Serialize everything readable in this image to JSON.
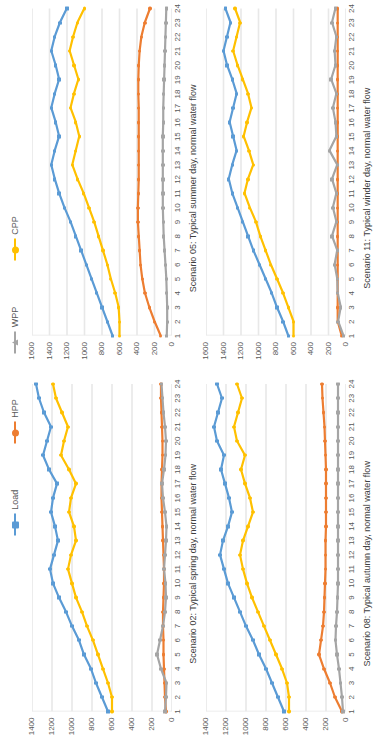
{
  "legend": {
    "items": [
      {
        "label": "Load",
        "color": "#5B9BD5",
        "marker": "square"
      },
      {
        "label": "HPP",
        "color": "#ED7D31",
        "marker": "circle"
      },
      {
        "label": "WPP",
        "color": "#A5A5A5",
        "marker": "triangle"
      },
      {
        "label": "CPP",
        "color": "#FFC000",
        "marker": "circle"
      }
    ]
  },
  "chart_data": [
    {
      "type": "line",
      "title": "Scenario 02: Typical spring day, normal water flow",
      "xlabel": "",
      "ylabel": "",
      "x": [
        1,
        2,
        3,
        4,
        5,
        6,
        7,
        8,
        9,
        10,
        11,
        12,
        13,
        14,
        15,
        16,
        17,
        18,
        19,
        20,
        21,
        22,
        23,
        24
      ],
      "xticklabels": [
        "1",
        "2",
        "3",
        "4",
        "5",
        "6",
        "7",
        "8",
        "9",
        "10",
        "11",
        "12",
        "13",
        "14",
        "15",
        "16",
        "17",
        "18",
        "19",
        "20",
        "21",
        "22",
        "23",
        "24"
      ],
      "ylim": [
        0,
        1400
      ],
      "yticks": [
        0,
        200,
        400,
        600,
        800,
        1000,
        1200,
        1400
      ],
      "grid": true,
      "series": [
        {
          "name": "Load",
          "color": "#5B9BD5",
          "values": [
            640,
            700,
            760,
            810,
            880,
            930,
            1000,
            1060,
            1130,
            1190,
            1220,
            1180,
            1140,
            1170,
            1210,
            1190,
            1150,
            1230,
            1290,
            1250,
            1210,
            1280,
            1330,
            1360
          ]
        },
        {
          "name": "HPP",
          "color": "#ED7D31",
          "values": [
            60,
            70,
            75,
            80,
            85,
            85,
            90,
            90,
            85,
            80,
            80,
            85,
            90,
            95,
            100,
            105,
            105,
            100,
            95,
            95,
            100,
            105,
            110,
            110
          ]
        },
        {
          "name": "WPP",
          "color": "#A5A5A5",
          "values": [
            70,
            60,
            55,
            110,
            150,
            120,
            90,
            70,
            60,
            65,
            80,
            70,
            60,
            55,
            70,
            90,
            100,
            80,
            65,
            60,
            70,
            85,
            95,
            105
          ]
        },
        {
          "name": "CPP",
          "color": "#FFC000",
          "values": [
            600,
            600,
            640,
            690,
            740,
            790,
            850,
            900,
            960,
            1000,
            1040,
            1010,
            960,
            980,
            1030,
            1010,
            960,
            1030,
            1110,
            1080,
            1040,
            1100,
            1160,
            1190
          ]
        }
      ]
    },
    {
      "type": "line",
      "title": "Scenario 05: Typical summer day, normal water flow",
      "xlabel": "",
      "ylabel": "",
      "x": [
        1,
        2,
        3,
        4,
        5,
        6,
        7,
        8,
        9,
        10,
        11,
        12,
        13,
        14,
        15,
        16,
        17,
        18,
        19,
        20,
        21,
        22,
        23,
        24
      ],
      "xticklabels": [
        "1",
        "2",
        "3",
        "4",
        "5",
        "6",
        "7",
        "8",
        "9",
        "10",
        "11",
        "12",
        "13",
        "14",
        "15",
        "16",
        "17",
        "18",
        "19",
        "20",
        "21",
        "22",
        "23",
        "24"
      ],
      "ylim": [
        0,
        1600
      ],
      "yticks": [
        0,
        200,
        400,
        600,
        800,
        1000,
        1200,
        1400,
        1600
      ],
      "grid": true,
      "series": [
        {
          "name": "Load",
          "color": "#5B9BD5",
          "values": [
            680,
            740,
            800,
            860,
            920,
            980,
            1040,
            1100,
            1160,
            1230,
            1290,
            1340,
            1380,
            1340,
            1290,
            1330,
            1380,
            1340,
            1290,
            1330,
            1380,
            1340,
            1280,
            1200
          ]
        },
        {
          "name": "HPP",
          "color": "#ED7D31",
          "values": [
            130,
            200,
            260,
            310,
            340,
            360,
            370,
            380,
            390,
            390,
            385,
            380,
            380,
            380,
            380,
            380,
            380,
            385,
            385,
            380,
            370,
            350,
            310,
            250
          ]
        },
        {
          "name": "WPP",
          "color": "#A5A5A5",
          "values": [
            60,
            55,
            55,
            60,
            65,
            75,
            85,
            95,
            100,
            105,
            105,
            105,
            105,
            105,
            105,
            100,
            100,
            95,
            90,
            85,
            80,
            75,
            70,
            65
          ]
        },
        {
          "name": "CPP",
          "color": "#FFC000",
          "values": [
            600,
            600,
            610,
            650,
            700,
            740,
            790,
            840,
            890,
            950,
            1010,
            1080,
            1140,
            1100,
            1060,
            1100,
            1160,
            1120,
            1070,
            1120,
            1170,
            1130,
            1080,
            1000
          ]
        }
      ]
    },
    {
      "type": "line",
      "title": "Scenario 08: Typical autumn day, normal water flow",
      "xlabel": "",
      "ylabel": "",
      "x": [
        1,
        2,
        3,
        4,
        5,
        6,
        7,
        8,
        9,
        10,
        11,
        12,
        13,
        14,
        15,
        16,
        17,
        18,
        19,
        20,
        21,
        22,
        23,
        24
      ],
      "xticklabels": [
        "1",
        "2",
        "3",
        "4",
        "5",
        "6",
        "7",
        "8",
        "9",
        "10",
        "11",
        "12",
        "13",
        "14",
        "15",
        "16",
        "17",
        "18",
        "19",
        "20",
        "21",
        "22",
        "23",
        "24"
      ],
      "ylim": [
        0,
        1400
      ],
      "yticks": [
        0,
        200,
        400,
        600,
        800,
        1000,
        1200,
        1400
      ],
      "grid": true,
      "series": [
        {
          "name": "Load",
          "color": "#5B9BD5",
          "values": [
            620,
            680,
            740,
            800,
            870,
            930,
            1000,
            1060,
            1120,
            1180,
            1220,
            1260,
            1230,
            1180,
            1140,
            1170,
            1210,
            1250,
            1220,
            1290,
            1320,
            1280,
            1240,
            1290
          ]
        },
        {
          "name": "HPP",
          "color": "#ED7D31",
          "values": [
            40,
            110,
            160,
            220,
            270,
            250,
            230,
            220,
            215,
            210,
            205,
            205,
            205,
            200,
            200,
            200,
            200,
            200,
            205,
            210,
            215,
            225,
            235,
            240
          ]
        },
        {
          "name": "WPP",
          "color": "#A5A5A5",
          "values": [
            30,
            40,
            55,
            70,
            90,
            105,
            100,
            90,
            85,
            80,
            80,
            80,
            80,
            80,
            80,
            80,
            80,
            80,
            80,
            80,
            80,
            80,
            80,
            80
          ]
        },
        {
          "name": "CPP",
          "color": "#FFC000",
          "values": [
            570,
            570,
            590,
            640,
            700,
            760,
            820,
            880,
            940,
            990,
            1030,
            1060,
            1030,
            980,
            930,
            960,
            1010,
            1050,
            1010,
            1090,
            1120,
            1080,
            1040,
            1090
          ]
        }
      ]
    },
    {
      "type": "line",
      "title": "Scenario 11: Typical winder day, normal water flow",
      "xlabel": "",
      "ylabel": "",
      "x": [
        1,
        2,
        3,
        4,
        5,
        6,
        7,
        8,
        9,
        10,
        11,
        12,
        13,
        14,
        15,
        16,
        17,
        18,
        19,
        20,
        21,
        22,
        23,
        24
      ],
      "xticklabels": [
        "1",
        "2",
        "3",
        "4",
        "5",
        "6",
        "7",
        "8",
        "9",
        "10",
        "11",
        "12",
        "13",
        "14",
        "15",
        "16",
        "17",
        "18",
        "19",
        "20",
        "21",
        "22",
        "23",
        "24"
      ],
      "ylim": [
        0,
        1600
      ],
      "yticks": [
        0,
        200,
        400,
        600,
        800,
        1000,
        1200,
        1400,
        1600
      ],
      "grid": true,
      "series": [
        {
          "name": "Load",
          "color": "#5B9BD5",
          "values": [
            660,
            720,
            790,
            850,
            920,
            990,
            1060,
            1120,
            1180,
            1240,
            1300,
            1340,
            1300,
            1250,
            1290,
            1330,
            1290,
            1250,
            1300,
            1360,
            1400,
            1360,
            1320,
            1380
          ]
        },
        {
          "name": "HPP",
          "color": "#ED7D31",
          "values": [
            50,
            95,
            95,
            95,
            95,
            95,
            95,
            95,
            95,
            95,
            95,
            95,
            95,
            95,
            95,
            95,
            95,
            95,
            95,
            95,
            95,
            95,
            95,
            95
          ]
        },
        {
          "name": "WPP",
          "color": "#A5A5A5",
          "values": [
            30,
            90,
            60,
            95,
            100,
            130,
            100,
            160,
            110,
            150,
            110,
            160,
            100,
            190,
            110,
            120,
            150,
            110,
            170,
            120,
            130,
            110,
            160,
            120
          ]
        },
        {
          "name": "CPP",
          "color": "#FFC000",
          "values": [
            600,
            600,
            660,
            720,
            790,
            860,
            920,
            980,
            1030,
            1100,
            1160,
            1120,
            1060,
            1110,
            1170,
            1130,
            1080,
            1120,
            1180,
            1240,
            1290,
            1250,
            1210,
            1270
          ]
        }
      ]
    }
  ]
}
